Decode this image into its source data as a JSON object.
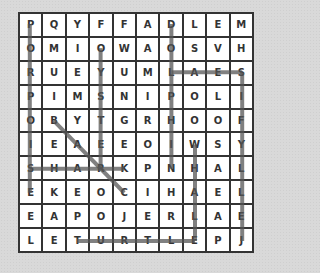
{
  "puzzle": {
    "rows": [
      [
        "P",
        "Q",
        "Y",
        "F",
        "F",
        "A",
        "D",
        "L",
        "E",
        "M"
      ],
      [
        "O",
        "M",
        "I",
        "O",
        "W",
        "A",
        "O",
        "S",
        "V",
        "H"
      ],
      [
        "R",
        "U",
        "E",
        "Y",
        "U",
        "M",
        "L",
        "A",
        "E",
        "S"
      ],
      [
        "P",
        "I",
        "M",
        "S",
        "N",
        "I",
        "P",
        "O",
        "L",
        "I"
      ],
      [
        "O",
        "B",
        "Y",
        "T",
        "G",
        "R",
        "H",
        "O",
        "O",
        "F"
      ],
      [
        "I",
        "E",
        "A",
        "E",
        "E",
        "O",
        "I",
        "W",
        "S",
        "Y"
      ],
      [
        "S",
        "H",
        "A",
        "R",
        "K",
        "P",
        "N",
        "H",
        "A",
        "L"
      ],
      [
        "E",
        "K",
        "E",
        "O",
        "C",
        "I",
        "H",
        "A",
        "E",
        "L"
      ],
      [
        "E",
        "A",
        "P",
        "O",
        "J",
        "E",
        "R",
        "L",
        "A",
        "E"
      ],
      [
        "L",
        "E",
        "T",
        "U",
        "R",
        "T",
        "L",
        "E",
        "P",
        "J"
      ]
    ],
    "found_words": [
      {
        "word": "PORPOISE",
        "from": [
          0,
          0
        ],
        "to": [
          7,
          0
        ]
      },
      {
        "word": "OYSTER",
        "from": [
          1,
          3
        ],
        "to": [
          6,
          3
        ]
      },
      {
        "word": "DOLPHIN",
        "from": [
          0,
          6
        ],
        "to": [
          6,
          6
        ]
      },
      {
        "word": "SEAL",
        "from": [
          2,
          9
        ],
        "to": [
          2,
          6
        ]
      },
      {
        "word": "SHARK",
        "from": [
          6,
          0
        ],
        "to": [
          6,
          4
        ]
      },
      {
        "word": "BEAR?",
        "from": [
          4,
          1
        ],
        "to": [
          7,
          4
        ]
      },
      {
        "word": "WHALE",
        "from": [
          5,
          7
        ],
        "to": [
          9,
          7
        ]
      },
      {
        "word": "JELLYFISH",
        "from": [
          9,
          9
        ],
        "to": [
          2,
          9
        ]
      },
      {
        "word": "TURTLE",
        "from": [
          9,
          2
        ],
        "to": [
          9,
          7
        ]
      }
    ],
    "highlight_color": "#555555"
  }
}
